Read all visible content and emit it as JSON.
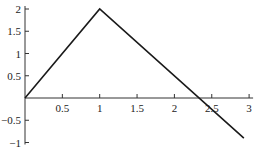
{
  "chart_data": {
    "type": "line",
    "title": "",
    "xlabel": "",
    "ylabel": "",
    "xlim": [
      0,
      3
    ],
    "ylim": [
      -1,
      2
    ],
    "grid": false,
    "legend": null,
    "x_ticks": [
      0.5,
      1,
      1.5,
      2,
      2.5,
      3
    ],
    "x_tick_labels": [
      "0.5",
      "1",
      "1.5",
      "2",
      "2.5",
      "3"
    ],
    "y_ticks": [
      -1,
      -0.5,
      0.5,
      1,
      1.5,
      2
    ],
    "y_tick_labels": [
      "−1",
      "−0.5",
      "0.5",
      "1",
      "1.5",
      "2"
    ],
    "series": [
      {
        "name": "piecewise linear",
        "x": [
          0,
          1,
          2.93
        ],
        "y": [
          0,
          2,
          -0.9
        ],
        "color": "#1a1a1a"
      }
    ]
  }
}
